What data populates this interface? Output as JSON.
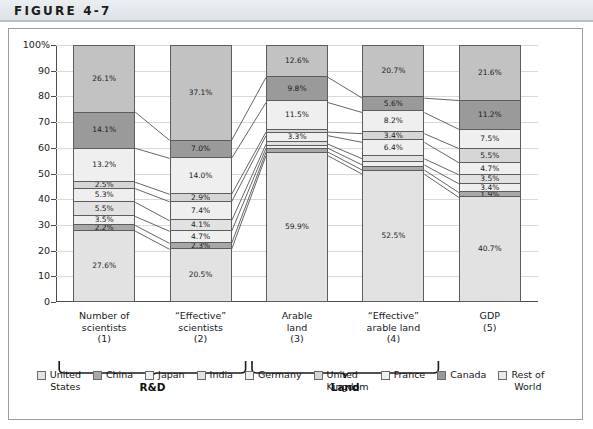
{
  "figure": {
    "label": "FIGURE 4-7"
  },
  "chart_data": {
    "type": "bar",
    "stacked": true,
    "title": "",
    "subtitle": "",
    "xlabel": "",
    "ylabel": "",
    "ylim": [
      0,
      100
    ],
    "ytick_labels": [
      "0",
      "10",
      "20",
      "30",
      "40",
      "50",
      "60",
      "70",
      "80",
      "90",
      "100%"
    ],
    "ytick_values": [
      0,
      10,
      20,
      30,
      40,
      50,
      60,
      70,
      80,
      90,
      100
    ],
    "grid": true,
    "legend_position": "bottom",
    "categories": [
      "Number of scientists (1)",
      "“Effective” scientists (2)",
      "Arable land (3)",
      "“Effective” arable land (4)",
      "GDP (5)"
    ],
    "category_lines": [
      [
        "Number of",
        "scientists",
        "(1)"
      ],
      [
        "“Effective”",
        "scientists",
        "(2)"
      ],
      [
        "Arable",
        "land",
        "(3)"
      ],
      [
        "“Effective”",
        "arable land",
        "(4)"
      ],
      [
        "GDP",
        "(5)"
      ]
    ],
    "groups": [
      {
        "label": "R&D",
        "categories": [
          "Number of scientists (1)",
          "“Effective” scientists (2)"
        ]
      },
      {
        "label": "Land",
        "categories": [
          "Arable land (3)",
          "“Effective” arable land (4)"
        ]
      }
    ],
    "series": [
      {
        "name": "United States",
        "color": "#e2e2e2",
        "values": [
          27.6,
          20.5,
          59.9,
          52.5,
          40.7
        ],
        "labels": [
          "27.6%",
          "20.5%",
          "59.9%",
          "52.5%",
          "40.7%"
        ]
      },
      {
        "name": "China",
        "color": "#a8a8a8",
        "values": [
          2.2,
          2.3,
          1.4,
          1.6,
          1.9
        ],
        "labels": [
          "2.2%",
          "2.3%",
          "",
          "",
          "1.9%"
        ]
      },
      {
        "name": "Japan",
        "color": "#efefef",
        "values": [
          3.5,
          4.7,
          1.5,
          2.0,
          3.4
        ],
        "labels": [
          "3.5%",
          "4.7%",
          "",
          "",
          "3.4%"
        ]
      },
      {
        "name": "India",
        "color": "#e2e2e2",
        "values": [
          5.5,
          4.1,
          1.6,
          2.4,
          3.5
        ],
        "labels": [
          "5.5%",
          "4.1%",
          "",
          "",
          "3.5%"
        ]
      },
      {
        "name": "Germany",
        "color": "#efefef",
        "values": [
          5.3,
          7.4,
          3.3,
          6.4,
          4.7
        ],
        "labels": [
          "5.3%",
          "7.4%",
          "3.3%",
          "6.4%",
          "4.7%"
        ]
      },
      {
        "name": "United Kingdom",
        "color": "#d6d6d6",
        "values": [
          2.5,
          2.9,
          1.4,
          3.4,
          5.5
        ],
        "labels": [
          "2.5%",
          "2.9%",
          "",
          "3.4%",
          "5.5%"
        ]
      },
      {
        "name": "France",
        "color": "#efefef",
        "values": [
          13.2,
          14.0,
          11.5,
          8.2,
          7.5
        ],
        "labels": [
          "13.2%",
          "14.0%",
          "11.5%",
          "8.2%",
          "7.5%"
        ]
      },
      {
        "name": "Canada",
        "color": "#9a9a9a",
        "values": [
          14.1,
          7.0,
          9.8,
          5.6,
          11.2
        ],
        "labels": [
          "14.1%",
          "7.0%",
          "9.8%",
          "5.6%",
          "11.2%"
        ]
      },
      {
        "name": "Rest of World",
        "color": "#c2c2c2",
        "values": [
          26.1,
          37.1,
          12.6,
          20.7,
          21.6
        ],
        "labels": [
          "26.1%",
          "37.1%",
          "12.6%",
          "20.7%",
          "21.6%"
        ]
      }
    ]
  },
  "legend": {
    "items": [
      {
        "label": "United States",
        "lines": [
          "United",
          "States"
        ],
        "color": "#e2e2e2"
      },
      {
        "label": "China",
        "lines": [
          "China"
        ],
        "color": "#a8a8a8"
      },
      {
        "label": "Japan",
        "lines": [
          "Japan"
        ],
        "color": "#efefef"
      },
      {
        "label": "India",
        "lines": [
          "India"
        ],
        "color": "#e2e2e2"
      },
      {
        "label": "Germany",
        "lines": [
          "Germany"
        ],
        "color": "#efefef"
      },
      {
        "label": "United Kingdom",
        "lines": [
          "United",
          "Kingdom"
        ],
        "color": "#d6d6d6"
      },
      {
        "label": "France",
        "lines": [
          "France"
        ],
        "color": "#efefef"
      },
      {
        "label": "Canada",
        "lines": [
          "Canada"
        ],
        "color": "#9a9a9a"
      },
      {
        "label": "Rest of World",
        "lines": [
          "Rest of",
          "World"
        ],
        "color": "#e9e9e9"
      }
    ]
  }
}
